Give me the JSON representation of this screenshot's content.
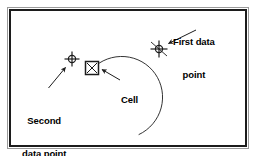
{
  "figure": {
    "kind": "cad-arc-construction-diagram",
    "background_color": "#ffffff",
    "frame": {
      "outer_border_color": "#9a9a9a",
      "inner_border_color": "#1c1c1c",
      "fill_color": "#ffffff"
    },
    "stroke_color": "#1c1c1c",
    "text_color": "#000000"
  },
  "labels": {
    "first_data_point": {
      "line1": "First data",
      "line2": "point"
    },
    "second_data_point": {
      "line1": "Second",
      "line2": "data point"
    },
    "cell": {
      "line1": "Cell"
    }
  },
  "markers": {
    "first_data_point": {
      "icon": "crosshair-circle-snap-marker",
      "x": 159,
      "y": 49
    },
    "second_data_point": {
      "icon": "crosshair-circle-marker",
      "x": 72,
      "y": 59
    },
    "cell": {
      "icon": "square-with-x-marker",
      "x": 92,
      "y": 68
    }
  },
  "geometry": {
    "arc": {
      "description": "open arc passing from cell marker up over first data point and down to lower right",
      "start": [
        92,
        68
      ],
      "end": [
        139,
        135
      ],
      "radius": 41
    },
    "leaders": [
      {
        "name": "first-data-point-leader",
        "from": [
          196,
          30
        ],
        "to": [
          167,
          44
        ]
      },
      {
        "name": "second-data-point-leader",
        "from": [
          49,
          87
        ],
        "to": [
          66,
          68
        ]
      },
      {
        "name": "cell-leader",
        "from": [
          119,
          79
        ],
        "to": [
          102,
          69
        ]
      }
    ]
  }
}
